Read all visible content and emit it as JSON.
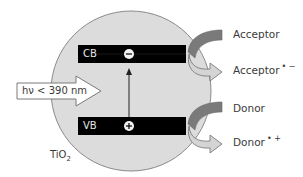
{
  "diagram": {
    "particle": {
      "label_main": "TiO",
      "label_sub": "2",
      "fill": "#dcdcdc",
      "stroke": "#8a8a8a"
    },
    "conduction_band": {
      "label": "CB",
      "carrier": "−",
      "carrier_name": "electron",
      "fill": "#000000"
    },
    "valence_band": {
      "label": "VB",
      "carrier": "+",
      "carrier_name": "hole",
      "fill": "#000000"
    },
    "excitation": {
      "arrow": "up-arrow",
      "from": "VB",
      "to": "CB"
    },
    "light": {
      "label": "hν < 390 nm"
    },
    "reactions": [
      {
        "band": "CB",
        "reactant": "Acceptor",
        "product": "Acceptor",
        "product_charge": "• −"
      },
      {
        "band": "VB",
        "reactant": "Donor",
        "product": "Donor",
        "product_charge": "• +"
      }
    ],
    "colors": {
      "incoming_arrow": "#7a7a7a",
      "outgoing_arrow": "#d4d4d4",
      "arrow_outline": "#6f6f6f",
      "text": "#3a3a3a"
    }
  }
}
